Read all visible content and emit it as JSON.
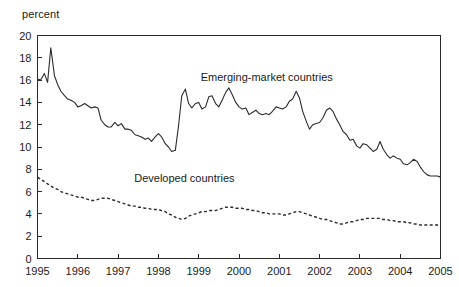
{
  "axis_unit_label": "percent",
  "labels": {
    "emerging": "Emerging-market countries",
    "developed": "Developed countries"
  },
  "chart_data": {
    "type": "line",
    "title": "",
    "subtitle": "",
    "xlabel": "",
    "ylabel": "percent",
    "xlim": [
      1995,
      2005
    ],
    "ylim": [
      0,
      20
    ],
    "ytick_labels": [
      "0",
      "2",
      "4",
      "6",
      "8",
      "10",
      "12",
      "14",
      "16",
      "18",
      "20"
    ],
    "ytick_values": [
      0,
      2,
      4,
      6,
      8,
      10,
      12,
      14,
      16,
      18,
      20
    ],
    "xtick_labels": [
      "1995",
      "1996",
      "1997",
      "1998",
      "1999",
      "2000",
      "2001",
      "2002",
      "2003",
      "2004",
      "2005"
    ],
    "xtick_values": [
      1995,
      1996,
      1997,
      1998,
      1999,
      2000,
      2001,
      2002,
      2003,
      2004,
      2005
    ],
    "grid": false,
    "legend_position": "inline-annotation",
    "annotations": [
      {
        "text": "Emerging-market countries",
        "x": 1999.05,
        "y": 15.9
      },
      {
        "text": "Developed countries",
        "x": 1997.4,
        "y": 6.9
      }
    ],
    "series": [
      {
        "name": "Emerging-market countries",
        "style": "solid",
        "color": "#2b2b2b",
        "x": [
          1995.0,
          1995.08,
          1995.17,
          1995.25,
          1995.33,
          1995.42,
          1995.5,
          1995.58,
          1995.67,
          1995.75,
          1995.83,
          1995.92,
          1996.0,
          1996.08,
          1996.17,
          1996.25,
          1996.33,
          1996.42,
          1996.5,
          1996.58,
          1996.67,
          1996.75,
          1996.83,
          1996.92,
          1997.0,
          1997.08,
          1997.17,
          1997.25,
          1997.33,
          1997.42,
          1997.5,
          1997.58,
          1997.67,
          1997.75,
          1997.83,
          1997.92,
          1998.0,
          1998.08,
          1998.17,
          1998.25,
          1998.33,
          1998.42,
          1998.5,
          1998.58,
          1998.67,
          1998.75,
          1998.83,
          1998.92,
          1999.0,
          1999.08,
          1999.17,
          1999.25,
          1999.33,
          1999.42,
          1999.5,
          1999.58,
          1999.67,
          1999.75,
          1999.83,
          1999.92,
          2000.0,
          2000.08,
          2000.17,
          2000.25,
          2000.33,
          2000.42,
          2000.5,
          2000.58,
          2000.67,
          2000.75,
          2000.83,
          2000.92,
          2001.0,
          2001.08,
          2001.17,
          2001.25,
          2001.33,
          2001.42,
          2001.5,
          2001.58,
          2001.67,
          2001.75,
          2001.83,
          2001.92,
          2002.0,
          2002.08,
          2002.17,
          2002.25,
          2002.33,
          2002.42,
          2002.5,
          2002.58,
          2002.67,
          2002.75,
          2002.83,
          2002.92,
          2003.0,
          2003.08,
          2003.17,
          2003.25,
          2003.33,
          2003.42,
          2003.5,
          2003.58,
          2003.67,
          2003.75,
          2003.83,
          2003.92,
          2004.0,
          2004.08,
          2004.17,
          2004.25,
          2004.33,
          2004.42,
          2004.5,
          2004.58,
          2004.67,
          2004.75,
          2004.83,
          2004.92,
          2005.0
        ],
        "values": [
          16.1,
          16.0,
          16.6,
          15.8,
          18.9,
          16.4,
          15.6,
          15.0,
          14.6,
          14.3,
          14.2,
          14.0,
          13.6,
          13.7,
          13.9,
          13.7,
          13.5,
          13.6,
          13.5,
          12.4,
          12.0,
          11.8,
          11.8,
          12.2,
          11.9,
          12.1,
          11.6,
          11.6,
          11.5,
          11.1,
          11.0,
          10.9,
          10.7,
          10.8,
          10.5,
          10.9,
          11.2,
          10.9,
          10.3,
          10.0,
          9.6,
          9.7,
          11.9,
          14.6,
          15.2,
          13.9,
          13.5,
          13.9,
          14.0,
          13.4,
          13.6,
          14.5,
          14.6,
          13.9,
          13.6,
          14.2,
          14.9,
          15.3,
          14.7,
          14.0,
          13.6,
          13.4,
          13.5,
          12.9,
          13.1,
          13.3,
          13.0,
          12.9,
          13.0,
          12.9,
          13.2,
          13.6,
          13.5,
          13.4,
          13.6,
          14.1,
          14.3,
          15.0,
          14.4,
          13.2,
          12.3,
          11.6,
          12.0,
          12.1,
          12.2,
          12.6,
          13.3,
          13.5,
          13.2,
          12.5,
          12.0,
          11.4,
          11.1,
          10.6,
          10.7,
          10.1,
          9.9,
          10.3,
          10.2,
          9.9,
          9.6,
          9.8,
          10.5,
          9.8,
          9.3,
          9.0,
          9.2,
          9.0,
          8.9,
          8.5,
          8.4,
          8.6,
          8.9,
          8.7,
          8.2,
          7.8,
          7.5,
          7.4,
          7.4,
          7.4,
          7.3
        ]
      },
      {
        "name": "Developed countries",
        "style": "dashed",
        "color": "#2b2b2b",
        "x": [
          1995.0,
          1995.08,
          1995.17,
          1995.25,
          1995.33,
          1995.42,
          1995.5,
          1995.58,
          1995.67,
          1995.75,
          1995.83,
          1995.92,
          1996.0,
          1996.08,
          1996.17,
          1996.25,
          1996.33,
          1996.42,
          1996.5,
          1996.58,
          1996.67,
          1996.75,
          1996.83,
          1996.92,
          1997.0,
          1997.08,
          1997.17,
          1997.25,
          1997.33,
          1997.42,
          1997.5,
          1997.58,
          1997.67,
          1997.75,
          1997.83,
          1997.92,
          1998.0,
          1998.08,
          1998.17,
          1998.25,
          1998.33,
          1998.42,
          1998.5,
          1998.58,
          1998.67,
          1998.75,
          1998.83,
          1998.92,
          1999.0,
          1999.08,
          1999.17,
          1999.25,
          1999.33,
          1999.42,
          1999.5,
          1999.58,
          1999.67,
          1999.75,
          1999.83,
          1999.92,
          2000.0,
          2000.08,
          2000.17,
          2000.25,
          2000.33,
          2000.42,
          2000.5,
          2000.58,
          2000.67,
          2000.75,
          2000.83,
          2000.92,
          2001.0,
          2001.08,
          2001.17,
          2001.25,
          2001.33,
          2001.42,
          2001.5,
          2001.58,
          2001.67,
          2001.75,
          2001.83,
          2001.92,
          2002.0,
          2002.08,
          2002.17,
          2002.25,
          2002.33,
          2002.42,
          2002.5,
          2002.58,
          2002.67,
          2002.75,
          2002.83,
          2002.92,
          2003.0,
          2003.08,
          2003.17,
          2003.25,
          2003.33,
          2003.42,
          2003.5,
          2003.58,
          2003.67,
          2003.75,
          2003.83,
          2003.92,
          2004.0,
          2004.08,
          2004.17,
          2004.25,
          2004.33,
          2004.42,
          2004.5,
          2004.58,
          2004.67,
          2004.75,
          2004.83,
          2004.92,
          2005.0
        ],
        "values": [
          7.3,
          7.1,
          6.9,
          6.7,
          6.5,
          6.3,
          6.2,
          6.0,
          5.9,
          5.8,
          5.7,
          5.6,
          5.5,
          5.5,
          5.4,
          5.3,
          5.2,
          5.2,
          5.3,
          5.4,
          5.4,
          5.4,
          5.3,
          5.2,
          5.1,
          5.0,
          4.9,
          4.8,
          4.7,
          4.7,
          4.6,
          4.6,
          4.5,
          4.5,
          4.4,
          4.4,
          4.4,
          4.3,
          4.2,
          4.0,
          3.9,
          3.7,
          3.6,
          3.5,
          3.6,
          3.8,
          3.9,
          4.0,
          4.1,
          4.2,
          4.2,
          4.3,
          4.3,
          4.3,
          4.4,
          4.5,
          4.6,
          4.6,
          4.6,
          4.5,
          4.5,
          4.5,
          4.4,
          4.4,
          4.3,
          4.3,
          4.2,
          4.1,
          4.1,
          4.0,
          4.0,
          4.0,
          4.0,
          3.9,
          3.9,
          4.0,
          4.1,
          4.2,
          4.2,
          4.1,
          4.0,
          3.9,
          3.8,
          3.7,
          3.6,
          3.5,
          3.5,
          3.4,
          3.3,
          3.2,
          3.1,
          3.1,
          3.2,
          3.3,
          3.3,
          3.4,
          3.5,
          3.5,
          3.6,
          3.6,
          3.6,
          3.6,
          3.6,
          3.5,
          3.5,
          3.4,
          3.4,
          3.3,
          3.3,
          3.3,
          3.2,
          3.2,
          3.1,
          3.1,
          3.0,
          3.0,
          3.0,
          3.0,
          3.0,
          3.0,
          3.0
        ]
      }
    ]
  }
}
